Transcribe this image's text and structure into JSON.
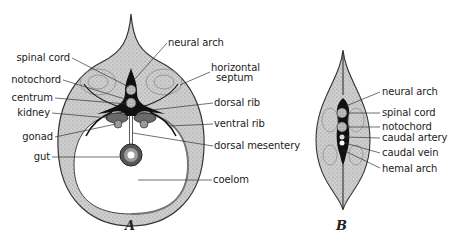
{
  "figure_a": {
    "caption": "A",
    "labels_left": [
      {
        "text": "spinal cord"
      },
      {
        "text": "notochord"
      },
      {
        "text": "centrum"
      },
      {
        "text": "kidney"
      },
      {
        "text": "gonad"
      },
      {
        "text": "gut"
      }
    ],
    "labels_right": [
      {
        "text": "neural arch"
      },
      {
        "text": "horizontal"
      },
      {
        "text": "septum"
      },
      {
        "text": "dorsal rib"
      },
      {
        "text": "ventral rib"
      },
      {
        "text": "dorsal mesentery"
      },
      {
        "text": "coelom"
      }
    ]
  },
  "figure_b": {
    "caption": "B",
    "labels": [
      {
        "text": "neural arch"
      },
      {
        "text": "spinal cord"
      },
      {
        "text": "notochord"
      },
      {
        "text": "caudal artery"
      },
      {
        "text": "caudal vein"
      },
      {
        "text": "hemal arch"
      }
    ]
  },
  "colors": {
    "tissue": "#c9c9c9",
    "bone": "#111111",
    "line": "#333333",
    "background": "#ffffff"
  }
}
